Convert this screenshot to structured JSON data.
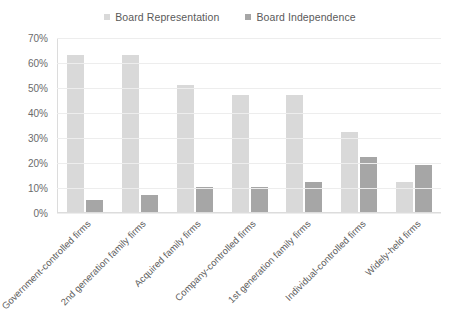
{
  "chart_data": {
    "type": "bar",
    "title": "",
    "subtitle": "",
    "xlabel": "",
    "ylabel": "",
    "ylim": [
      0,
      70
    ],
    "ytick_step": 10,
    "ytick_labels": [
      "70%",
      "60%",
      "50%",
      "40%",
      "30%",
      "20%",
      "10%",
      "0%"
    ],
    "ytick_values": [
      70,
      60,
      50,
      40,
      30,
      20,
      10,
      0
    ],
    "grid": true,
    "legend_position": "top-center",
    "value_suffix": "%",
    "categories": [
      "Government-controlled firms",
      "2nd generation family firms",
      "Acquired family firms",
      "Company-controlled firms",
      "1st generation family firms",
      "Individual-controlled firms",
      "Widely-held firms"
    ],
    "series": [
      {
        "name": "Board Representation",
        "color": "#d9d9d9",
        "values": [
          63,
          63,
          51,
          47,
          47,
          32,
          12
        ]
      },
      {
        "name": "Board Independence",
        "color": "#a6a6a6",
        "values": [
          5,
          7,
          10,
          10,
          12,
          22,
          19
        ]
      }
    ]
  },
  "colors": {
    "background": "#ffffff",
    "gridline": "#ededed",
    "axis": "#dcdcdc",
    "tick_text": "#6b6b6b",
    "label_text": "#5e5e5e",
    "legend_text": "#5a5a5a"
  }
}
